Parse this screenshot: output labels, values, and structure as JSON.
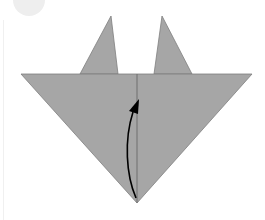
{
  "diagram": {
    "kind": "origami-fold-step",
    "colors": {
      "paper": "#a6a6a6",
      "paper_edge": "#7f7f7f",
      "fold_line": "#6e6e6e",
      "arrow": "#000000",
      "background": "#ffffff",
      "step_badge": "#eeeeee"
    },
    "shapes": {
      "left_ear": "80,74 111,16 118,74",
      "right_ear": "154,74 162,16 192,74",
      "main_triangle": "21,74 252,74 137,203",
      "center_fold": {
        "x1": 137,
        "y1": 74,
        "x2": 137,
        "y2": 203
      }
    },
    "arrow": {
      "path": "M136,198 C126,175 124,140 133,112",
      "head": "129,111 139,99 138,114",
      "meaning": "fold bottom tip upward"
    }
  }
}
